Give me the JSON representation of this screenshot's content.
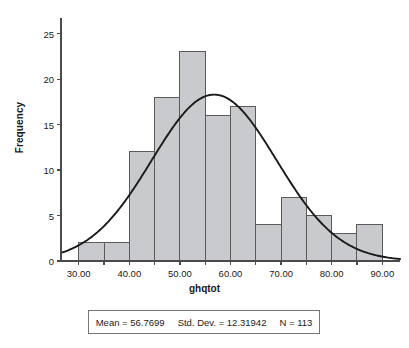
{
  "chart_data": {
    "type": "bar",
    "title": "",
    "subtitle": "",
    "xlabel": "ghqtot",
    "ylabel": "Frequency",
    "xlim": [
      26.5,
      93.5
    ],
    "ylim": [
      0,
      26.5
    ],
    "grid": false,
    "legend_position": "none",
    "bin_width": 5,
    "xticks": [
      "30.00",
      "40.00",
      "50.00",
      "60.00",
      "70.00",
      "80.00",
      "90.00"
    ],
    "xtick_values": [
      30,
      40,
      50,
      60,
      70,
      80,
      90
    ],
    "yticks": [
      "0",
      "5",
      "10",
      "15",
      "20",
      "25"
    ],
    "ytick_values": [
      0,
      5,
      10,
      15,
      20,
      25
    ],
    "categories": [
      "30-35",
      "35-40",
      "40-45",
      "45-50",
      "50-55",
      "55-60",
      "60-65",
      "65-70",
      "70-75",
      "75-80",
      "80-85",
      "85-90"
    ],
    "bin_edges": [
      30,
      35,
      40,
      45,
      50,
      55,
      60,
      65,
      70,
      75,
      80,
      85,
      90
    ],
    "values": [
      2,
      2,
      12,
      18,
      23,
      16,
      17,
      4,
      7,
      5,
      3,
      4
    ],
    "series": [
      {
        "name": "ghqtot",
        "values": [
          2,
          2,
          12,
          18,
          23,
          16,
          17,
          4,
          7,
          5,
          3,
          4
        ]
      }
    ],
    "overlay": {
      "type": "normal-curve",
      "mean": 56.7699,
      "std_dev": 12.31942,
      "n": 113,
      "scale_bin_width": 5,
      "color": "#1a1a1a"
    },
    "bar_fill": "#c9cace",
    "bar_stroke": "#5a5a5a",
    "axis_color": "#4a4a4a"
  },
  "stats": {
    "mean": "Mean = 56.7699",
    "std_dev": "Std. Dev. = 12.31942",
    "n": "N = 113"
  }
}
